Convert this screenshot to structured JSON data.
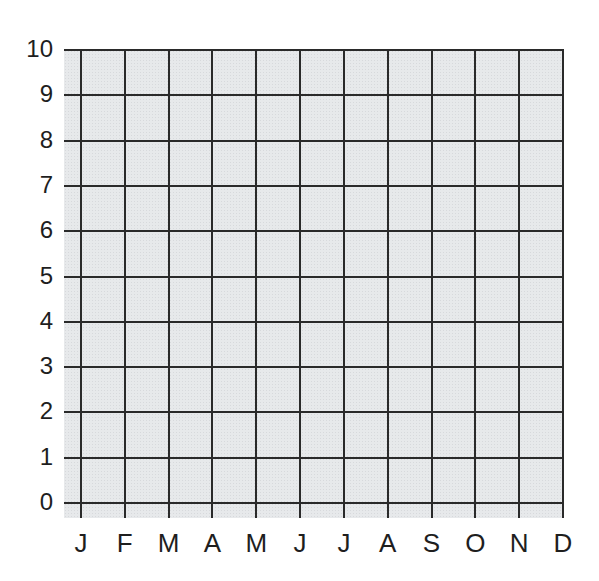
{
  "chart_data": {
    "type": "line",
    "title": "",
    "xlabel": "",
    "ylabel": "",
    "categories": [
      "J",
      "F",
      "M",
      "A",
      "M",
      "J",
      "J",
      "A",
      "S",
      "O",
      "N",
      "D"
    ],
    "y_ticks": [
      "10",
      "9",
      "8",
      "7",
      "6",
      "5",
      "4",
      "3",
      "2",
      "1",
      "0"
    ],
    "ylim": [
      0,
      10
    ],
    "grid": true,
    "series": [],
    "note": "Blank graph grid with no plotted data"
  }
}
